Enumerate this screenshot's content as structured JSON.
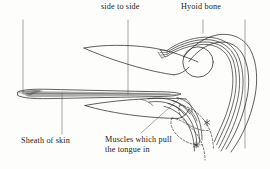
{
  "figure": {
    "kind": "anatomical-diagram",
    "background_color": "#fdfdfc",
    "line_color": "#2a2a2a",
    "text_color": "#232323"
  },
  "labels": {
    "side_to_side": "side to side",
    "hyoid_bone": "Hyoid bone",
    "sheath_of_skin": "Sheath of skin",
    "muscles_line1": "Muscles which pull",
    "muscles_line2": "the tongue in"
  },
  "markers": {
    "asterisk_upper": "✲",
    "asterisk_lower": "✲"
  },
  "leaders": [
    {
      "name": "side-to-side-leader",
      "x1": 128,
      "y1": 20,
      "x2": 128,
      "y2": 95
    },
    {
      "name": "hyoid-bone-leader",
      "x1": 203,
      "y1": 20,
      "x2": 203,
      "y2": 33
    },
    {
      "name": "top-left-leader",
      "x1": 23,
      "y1": 20,
      "x2": 23,
      "y2": 92
    },
    {
      "name": "top-right-leader",
      "x1": 245,
      "y1": 20,
      "x2": 245,
      "y2": 148
    },
    {
      "name": "sheath-leader",
      "x1": 62,
      "y1": 93,
      "x2": 62,
      "y2": 134
    },
    {
      "name": "muscles-leader",
      "x1": 141,
      "y1": 133,
      "x2": 178,
      "y2": 100
    }
  ]
}
